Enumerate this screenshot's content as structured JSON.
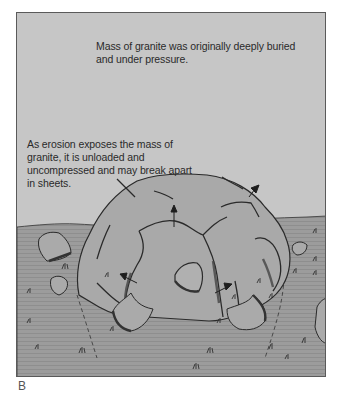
{
  "figure": {
    "panel_label": "B",
    "annotations": {
      "top": "Mass of granite was originally deeply buried and under pressure.",
      "middle": "As erosion exposes the mass of granite, it is unloaded and uncompressed and may break apart in sheets."
    },
    "elements": {
      "sky": "sky",
      "ground": "ground-plane",
      "dome": "exfoliation-dome",
      "arrows": "expansion-arrows",
      "dashed_lines": "original-extent-dashed-lines",
      "boulders": "loose-rock-sheets",
      "grass": "grass-tufts"
    },
    "colors": {
      "sky": "#c6c6c6",
      "ground": "#9c9c9c",
      "rock": "#a9a9a9",
      "outline": "#2a2a2a",
      "frame": "#5a5a5a"
    }
  }
}
